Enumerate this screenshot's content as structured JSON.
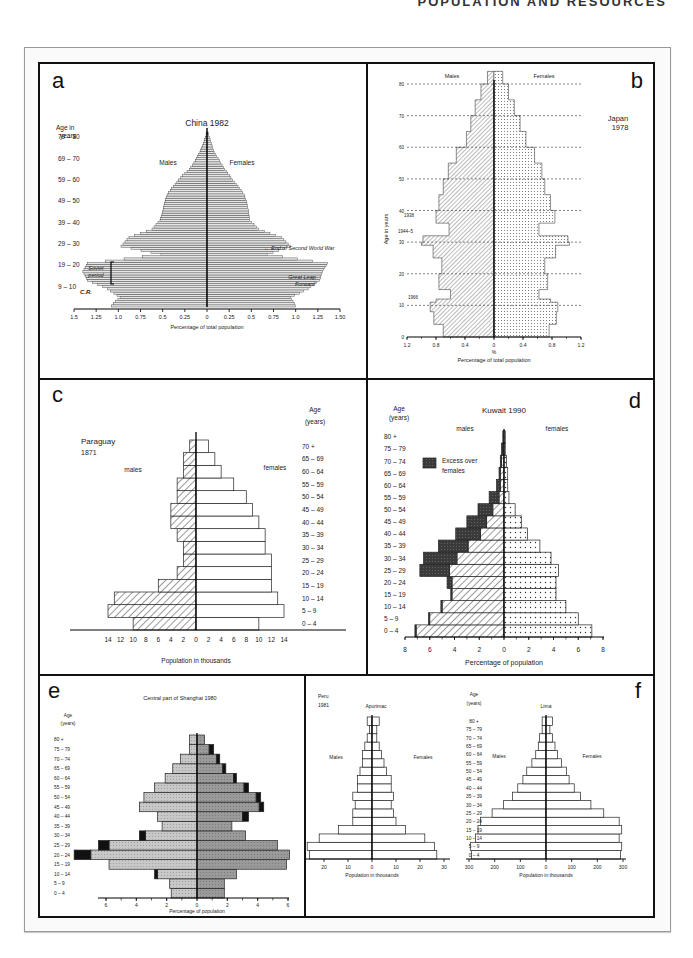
{
  "running_head": "POPULATION AND RESOURCES",
  "chart_data": [
    {
      "panel": "a",
      "type": "bar",
      "orientation": "horizontal-pyramid",
      "title": "China 1982",
      "xlabel": "Percentage of total population",
      "ylabel": "Age in years",
      "left_label": "Males",
      "right_label": "Females",
      "x_ticks_left": [
        "1.5",
        "1.25",
        "1.0",
        "0.75",
        "0.5",
        "0.25",
        "0"
      ],
      "x_ticks_right": [
        "0.25",
        "0.5",
        "0.75",
        "1.0",
        "1.25",
        "1.50"
      ],
      "y_ticks": [
        "79 – 80",
        "69 – 70",
        "59 – 60",
        "49 – 50",
        "39 – 40",
        "29 – 30",
        "19 – 20",
        "9 – 10"
      ],
      "annotations": [
        "End of Second World War",
        "Soviet period",
        "Great Leap Forward",
        "C.R."
      ],
      "xlim": [
        -1.5,
        1.5
      ],
      "ages": [
        0,
        4,
        8,
        12,
        16,
        20,
        24,
        28,
        32,
        36,
        40,
        44,
        48,
        52,
        56,
        60,
        64,
        68,
        72,
        76,
        80
      ],
      "males": [
        1.08,
        0.98,
        1.12,
        1.35,
        1.4,
        1.35,
        0.52,
        0.97,
        0.88,
        0.62,
        0.53,
        0.5,
        0.48,
        0.45,
        0.38,
        0.3,
        0.2,
        0.13,
        0.08,
        0.04,
        0.01
      ],
      "females": [
        1.0,
        0.94,
        1.14,
        1.27,
        1.3,
        1.36,
        0.68,
        0.94,
        0.84,
        0.58,
        0.48,
        0.47,
        0.45,
        0.42,
        0.35,
        0.27,
        0.2,
        0.14,
        0.08,
        0.05,
        0.02
      ]
    },
    {
      "panel": "b",
      "type": "area",
      "orientation": "horizontal-pyramid",
      "title": "Japan 1978",
      "xlabel": "Percentage of total population",
      "xunit": "%",
      "ylabel": "Age in years",
      "left_label": "Males",
      "right_label": "Females",
      "x_ticks": [
        "1.2",
        "0.8",
        "0.4",
        "0",
        "0.4",
        "0.8",
        "1.2"
      ],
      "y_ticks": [
        "0",
        "10",
        "20",
        "30",
        "40",
        "50",
        "60",
        "70",
        "80"
      ],
      "annotations": [
        "1938",
        "1944–5",
        "1966"
      ],
      "xlim": [
        -1.2,
        1.2
      ],
      "ylim": [
        0,
        85
      ],
      "ages": [
        0,
        4,
        8,
        11,
        12,
        15,
        20,
        25,
        29,
        30,
        32,
        33,
        36,
        40,
        45,
        50,
        55,
        60,
        65,
        70,
        75,
        80,
        84
      ],
      "males": [
        0.7,
        0.83,
        0.88,
        0.8,
        0.6,
        0.76,
        0.72,
        0.84,
        1.0,
        0.98,
        0.62,
        0.62,
        0.8,
        0.76,
        0.7,
        0.63,
        0.52,
        0.38,
        0.32,
        0.26,
        0.18,
        0.09,
        0.0
      ],
      "females": [
        0.76,
        0.86,
        0.88,
        0.78,
        0.62,
        0.74,
        0.7,
        0.85,
        1.04,
        1.02,
        0.62,
        0.62,
        0.84,
        0.78,
        0.7,
        0.66,
        0.56,
        0.44,
        0.36,
        0.28,
        0.2,
        0.12,
        0.0
      ]
    },
    {
      "panel": "c",
      "type": "bar",
      "orientation": "horizontal-pyramid",
      "title": "Paraguay 1871",
      "xlabel": "Population in thousands",
      "ylabel": "Age (years)",
      "left_label": "males",
      "right_label": "females",
      "x_ticks": [
        "14",
        "12",
        "10",
        "8",
        "6",
        "4",
        "2",
        "0",
        "2",
        "4",
        "6",
        "8",
        "10",
        "12",
        "14"
      ],
      "categories": [
        "0 – 4",
        "5 – 9",
        "10 – 14",
        "15 – 19",
        "20 – 24",
        "25 – 29",
        "30 – 34",
        "35 – 39",
        "40 – 44",
        "45 – 49",
        "50 – 54",
        "55 – 59",
        "60 – 64",
        "65 – 69",
        "70 +"
      ],
      "males": [
        10,
        14,
        13,
        6,
        3,
        2,
        2,
        3,
        4,
        4,
        3,
        3,
        2,
        2,
        1
      ],
      "females": [
        10,
        14,
        13,
        12,
        12,
        12,
        11,
        11,
        10,
        9,
        8,
        6,
        4,
        3,
        2
      ],
      "xlim": [
        -14,
        14
      ]
    },
    {
      "panel": "d",
      "type": "bar",
      "orientation": "horizontal-pyramid",
      "title": "Kuwait 1990",
      "xlabel": "Percentage of population",
      "ylabel": "Age (years)",
      "left_label": "males",
      "right_label": "females",
      "legend": [
        "Excess over females"
      ],
      "x_ticks": [
        "8",
        "6",
        "4",
        "2",
        "0",
        "2",
        "4",
        "6",
        "8"
      ],
      "categories": [
        "0 – 4",
        "5 – 9",
        "10 – 14",
        "15 – 19",
        "20 – 24",
        "25 – 29",
        "30 – 34",
        "35 – 39",
        "40 – 44",
        "45 – 49",
        "50 – 54",
        "55 – 59",
        "60 – 64",
        "65 – 69",
        "70 – 74",
        "75 – 79",
        "80 +"
      ],
      "males": [
        7.2,
        6.1,
        5.1,
        4.3,
        4.6,
        6.8,
        6.5,
        5.3,
        3.9,
        3.0,
        2.1,
        1.2,
        0.6,
        0.4,
        0.3,
        0.2,
        0.1
      ],
      "females": [
        7.1,
        6.0,
        5.0,
        4.2,
        4.2,
        4.4,
        3.8,
        2.9,
        1.9,
        1.4,
        0.9,
        0.4,
        0.3,
        0.3,
        0.2,
        0.1,
        0.1
      ],
      "xlim": [
        -8,
        8
      ]
    },
    {
      "panel": "e",
      "type": "bar",
      "orientation": "horizontal-pyramid",
      "title": "Central part of Shanghai 1980",
      "xlabel": "Percentage of population",
      "ylabel": "Age (years)",
      "x_ticks": [
        "6",
        "4",
        "2",
        "0",
        "2",
        "4",
        "6"
      ],
      "categories": [
        "0 – 4",
        "5 – 9",
        "10 – 14",
        "15 – 19",
        "20 – 24",
        "25 – 29",
        "30 – 34",
        "35 – 39",
        "40 – 44",
        "45 – 49",
        "50 – 54",
        "55 – 59",
        "60 – 64",
        "65 – 69",
        "70 – 74",
        "75 – 79",
        "80 +"
      ],
      "males": [
        1.7,
        1.8,
        2.6,
        5.8,
        7.0,
        5.8,
        3.4,
        2.3,
        2.6,
        3.8,
        3.5,
        2.8,
        2.1,
        1.6,
        1.1,
        0.5,
        0.5
      ],
      "females": [
        1.8,
        1.8,
        2.6,
        5.9,
        6.1,
        5.3,
        3.2,
        2.3,
        3.0,
        4.1,
        3.9,
        3.1,
        2.4,
        1.7,
        1.3,
        0.8,
        0.5
      ],
      "males_excess": [
        0.0,
        0.0,
        0.2,
        0.0,
        1.1,
        0.7,
        0.4,
        0.0,
        0.0,
        0.0,
        0.0,
        0.0,
        0.0,
        0.0,
        0.0,
        0.0,
        0.0
      ],
      "females_excess": [
        0.0,
        0.0,
        0.0,
        0.0,
        0.0,
        0.0,
        0.0,
        0.0,
        0.4,
        0.3,
        0.3,
        0.3,
        0.2,
        0.2,
        0.2,
        0.3,
        0.0
      ],
      "xlim": [
        -6,
        6
      ]
    },
    {
      "panel": "f",
      "type": "bar",
      "orientation": "horizontal-pyramid",
      "title": "Peru 1981",
      "subcharts": [
        {
          "title": "Apurimac",
          "xlabel": "Population in thousands",
          "left_label": "Males",
          "right_label": "Females",
          "x_ticks": [
            "30",
            "20",
            "10",
            "0",
            "10",
            "20",
            "30"
          ],
          "males": [
            26,
            27,
            22,
            14,
            8,
            8,
            7,
            8,
            6,
            6,
            5,
            4,
            4,
            3,
            2,
            1,
            2
          ],
          "females": [
            27,
            26,
            22,
            14,
            10,
            9,
            8,
            9,
            8,
            8,
            6,
            5,
            4,
            3,
            2,
            2,
            3
          ],
          "xlim": [
            -30,
            30
          ]
        },
        {
          "title": "Lima",
          "xlabel": "Population in thousands",
          "left_label": "Males",
          "right_label": "Females",
          "x_ticks": [
            "300",
            "200",
            "100",
            "0",
            "100",
            "200",
            "300"
          ],
          "males": [
            290,
            295,
            275,
            265,
            255,
            210,
            165,
            130,
            110,
            90,
            75,
            55,
            40,
            30,
            25,
            15,
            15
          ],
          "females": [
            290,
            295,
            285,
            295,
            285,
            225,
            175,
            135,
            110,
            90,
            80,
            60,
            45,
            35,
            25,
            15,
            25
          ],
          "xlim": [
            -300,
            300
          ]
        }
      ],
      "ylabel": "Age (years)",
      "categories": [
        "0 – 4",
        "5 – 9",
        "10 – 14",
        "15 – 19",
        "20 – 24",
        "25 – 29",
        "30 – 34",
        "35 – 39",
        "40 – 44",
        "45 – 49",
        "50 – 54",
        "55 – 59",
        "60 – 64",
        "65 – 69",
        "70 – 74",
        "75 – 79",
        "80 +"
      ]
    }
  ],
  "panels": {
    "a": {
      "letter": "a"
    },
    "b": {
      "letter": "b"
    },
    "c": {
      "letter": "c"
    },
    "d": {
      "letter": "d"
    },
    "e": {
      "letter": "e"
    },
    "f": {
      "letter": "f"
    }
  }
}
